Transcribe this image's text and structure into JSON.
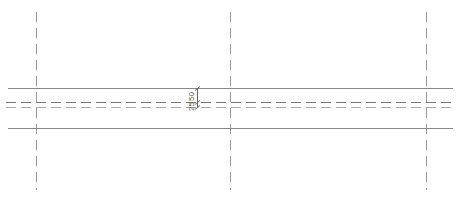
{
  "drawing": {
    "type": "CAD section / plan view",
    "gridlines": [
      {
        "id": "grid-left",
        "x": 36
      },
      {
        "id": "grid-middle",
        "x": 230
      },
      {
        "id": "grid-right",
        "x": 426
      }
    ],
    "boundary_lines": [
      {
        "id": "top-edge",
        "y": 88
      },
      {
        "id": "bottom-edge",
        "y": 128
      }
    ],
    "dashed_lines": [
      {
        "id": "dashed-upper",
        "y": 102,
        "color": "#777777"
      },
      {
        "id": "dashed-lower",
        "y": 107,
        "color": "#aaaaaa"
      }
    ],
    "dimensions": {
      "upper_value": "50",
      "lower_value": "25"
    },
    "colors": {
      "line": "#888888",
      "gridline": "#999999",
      "dim": "#666666"
    }
  }
}
